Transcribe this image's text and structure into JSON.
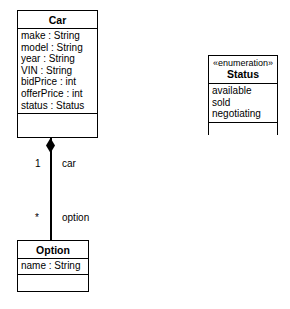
{
  "diagram": {
    "kind": "uml-class-diagram",
    "background_color": "#ffffff",
    "line_color": "#000000"
  },
  "classes": {
    "car": {
      "name": "Car",
      "attributes": [
        "make : String",
        "model : String",
        "year : String",
        "VIN : String",
        "bidPrice : int",
        "offerPrice : int",
        "status : Status"
      ],
      "operations": []
    },
    "option": {
      "name": "Option",
      "attributes": [
        "name : String"
      ],
      "operations": []
    }
  },
  "enumerations": {
    "status": {
      "stereotype": "«enumeration»",
      "name": "Status",
      "literals": [
        "available",
        "sold",
        "negotiating"
      ],
      "operations": []
    }
  },
  "association": {
    "type": "composition",
    "owner_end": {
      "multiplicity": "1",
      "role": "car"
    },
    "part_end": {
      "multiplicity": "*",
      "role": "option"
    }
  }
}
